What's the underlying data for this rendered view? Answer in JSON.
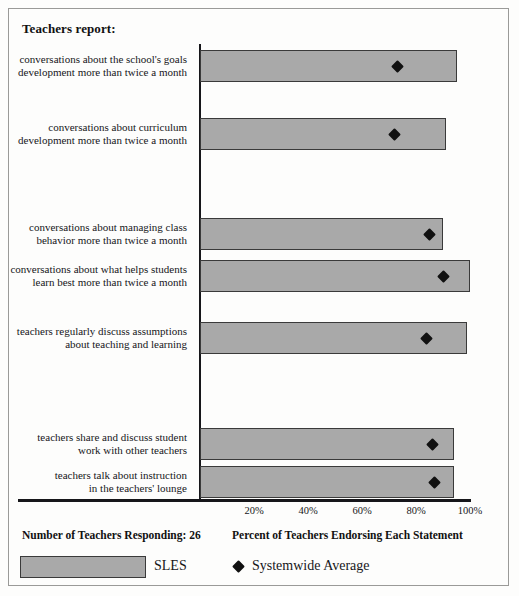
{
  "report": {
    "title": "Teachers report:",
    "respondents_label": "Number of Teachers Responding: 26",
    "school_code": "SLES",
    "systemwide_legend": "Systemwide Average"
  },
  "chart_data": {
    "type": "bar",
    "orientation": "horizontal",
    "title": "Teachers report:",
    "xlabel": "Percent of Teachers Endorsing Each Statement",
    "ylabel": "",
    "xlim": [
      0,
      100
    ],
    "xticks": [
      20,
      40,
      60,
      80,
      100
    ],
    "xtick_labels": [
      "20%",
      "40%",
      "60%",
      "80%",
      "100%"
    ],
    "grid": false,
    "legend_position": "bottom",
    "categories": [
      "conversations about the school's goals development more than twice a month",
      "conversations about curriculum development more than twice a month",
      "conversations about managing class behavior more than twice a month",
      "conversations about what helps students learn best more than twice a month",
      "teachers regularly discuss assumptions about teaching and learning",
      "teachers share and discuss student work with other teachers",
      "teachers talk about instruction in the teachers' lounge"
    ],
    "category_lines": [
      [
        "conversations about the school's goals",
        "development more than twice a month"
      ],
      [
        "conversations about curriculum",
        "development more than twice a month"
      ],
      [
        "conversations about managing class",
        "behavior more than twice a month"
      ],
      [
        "conversations about what helps students",
        "learn best more than twice a month"
      ],
      [
        "teachers regularly discuss assumptions",
        "about teaching and learning"
      ],
      [
        "teachers share and discuss student",
        "work with other teachers"
      ],
      [
        "teachers talk about instruction",
        "in the teachers' lounge"
      ]
    ],
    "series": [
      {
        "name": "SLES",
        "type": "bar",
        "color": "#a9a9a9",
        "values": [
          95,
          91,
          90,
          100,
          99,
          94,
          94
        ]
      },
      {
        "name": "Systemwide Average",
        "type": "marker",
        "marker": "diamond",
        "color": "#111111",
        "values": [
          73,
          72,
          85,
          90,
          84,
          86,
          87
        ]
      }
    ]
  }
}
